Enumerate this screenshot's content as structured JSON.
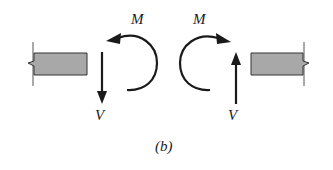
{
  "figure": {
    "caption": "(b)",
    "left_segment": {
      "moment_label": "M",
      "shear_label": "V",
      "moment_direction": "counterclockwise",
      "shear_direction": "down"
    },
    "right_segment": {
      "moment_label": "M",
      "shear_label": "V",
      "moment_direction": "clockwise",
      "shear_direction": "up"
    }
  },
  "colors": {
    "beam_fill": "#a8a8a8",
    "ink": "#1a1a1a"
  }
}
